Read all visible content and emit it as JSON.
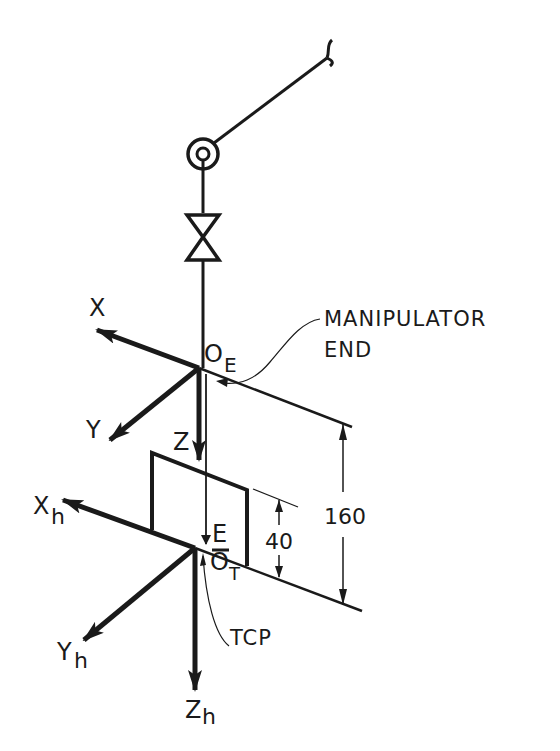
{
  "diagram": {
    "type": "robot-end-effector-coordinate-frames",
    "stroke_color": "#1a1a1a",
    "background": "#ffffff",
    "elements": {
      "arm_link": "manipulator-link",
      "revolute_joint": "revolute-joint-symbol",
      "prismatic_joint": "valve-bowtie-joint-symbol",
      "tool": "end-effector-plate"
    },
    "frames": {
      "end_frame": {
        "origin_label": "O",
        "origin_subscript": "E",
        "axes": {
          "x": "X",
          "y": "Y",
          "z": "Z"
        }
      },
      "tool_frame": {
        "origin_label": "O",
        "origin_subscript": "T",
        "axes": {
          "x": "X",
          "x_sub": "h",
          "y": "Y",
          "y_sub": "h",
          "z": "Z",
          "z_sub": "h"
        }
      }
    },
    "labels": {
      "callout_line1": "MANIPULATOR",
      "callout_line2": "END",
      "tcp": "TCP",
      "vector_e": "E"
    },
    "dimensions": {
      "total": "160",
      "tool": "40"
    }
  }
}
